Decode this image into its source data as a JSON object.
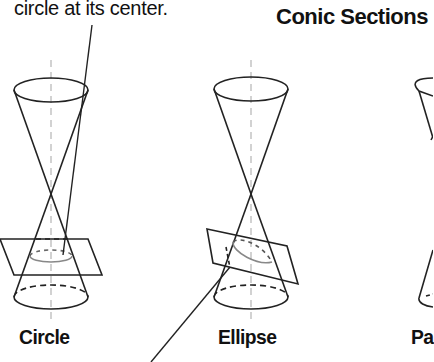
{
  "diagram": {
    "title": "Conic Sections",
    "annotation_top": "circle at its center.",
    "figures": [
      {
        "id": "circle",
        "label": "Circle"
      },
      {
        "id": "ellipse",
        "label": "Ellipse"
      },
      {
        "id": "parabola",
        "label": "Pa"
      }
    ],
    "colors": {
      "stroke": "#222222",
      "axis_dash": "#bbbbbb",
      "text": "#111111",
      "background": "#ffffff"
    }
  }
}
